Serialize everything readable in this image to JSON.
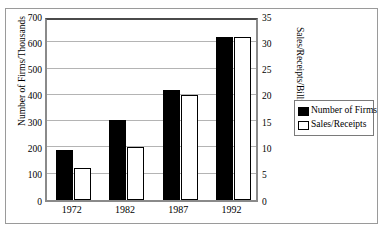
{
  "chart_data": {
    "type": "bar",
    "title": "",
    "subtitle": "",
    "categories": [
      "1972",
      "1982",
      "1987",
      "1992"
    ],
    "series": [
      {
        "name": "Number of Firms",
        "axis": "left",
        "color": "#000000",
        "values": [
          190,
          305,
          420,
          620
        ]
      },
      {
        "name": "Sales/Receipts",
        "axis": "right",
        "color": "#ffffff",
        "values": [
          6,
          10,
          20,
          31
        ]
      }
    ],
    "xlabel": "",
    "ylabel": "Number of Firms/Thousands",
    "ylabel_right": "Sales/Receipts/Billions",
    "ylim": [
      0,
      700
    ],
    "ylim_right": [
      0,
      35
    ],
    "ytick_step": 100,
    "ytick_step_right": 5,
    "yticks_left": [
      "0",
      "100",
      "200",
      "300",
      "400",
      "500",
      "600",
      "700"
    ],
    "yticks_right": [
      "0",
      "5",
      "10",
      "15",
      "20",
      "25",
      "30",
      "35"
    ],
    "grid": true,
    "grid_axis": "y",
    "legend_position": "right-middle",
    "legend": [
      "Number of Firms",
      "Sales/Receipts"
    ]
  },
  "axes": {
    "left_title": "Number of Firms/Thousands",
    "right_title": "Sales/Receipts/Billions"
  },
  "legend": {
    "items": [
      {
        "label": "Number of Firms",
        "swatch": "filled-black-square"
      },
      {
        "label": "Sales/Receipts",
        "swatch": "outlined-white-square"
      }
    ]
  }
}
